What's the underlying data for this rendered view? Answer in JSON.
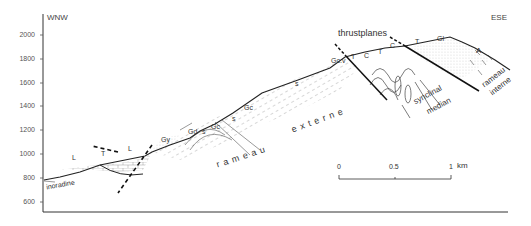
{
  "figure": {
    "orientation": {
      "left": "WNW",
      "right": "ESE"
    },
    "y_axis": {
      "ticks": [
        "2000",
        "1800",
        "1600",
        "1400",
        "1200",
        "1000",
        "800",
        "600"
      ]
    },
    "scale_bar": {
      "labels": [
        "0",
        "0.5",
        "1"
      ],
      "unit": "km"
    },
    "annotations": {
      "thrustplanes": "thrustplanes",
      "rameau_externe_1": "rameau",
      "rameau_externe_2": "externe",
      "synclinal_1": "synclinal",
      "synclinal_2": "median",
      "rameau_interne_1": "rameau",
      "rameau_interne_2": "interne",
      "inoradine": "inoradine"
    },
    "unit_labels": {
      "L1": "L",
      "T1": "T",
      "L2": "L",
      "Gy": "Gy",
      "Gd": "Gd",
      "s1": "s",
      "Gc1": "Gc",
      "s2": "s",
      "Gc2": "Gc",
      "s3": "s",
      "Gcv": "Gc.v",
      "T2": "T",
      "C1": "C",
      "T3": "T",
      "C2": "C",
      "T4": "T",
      "Gl": "Gl",
      "A": "A"
    }
  }
}
